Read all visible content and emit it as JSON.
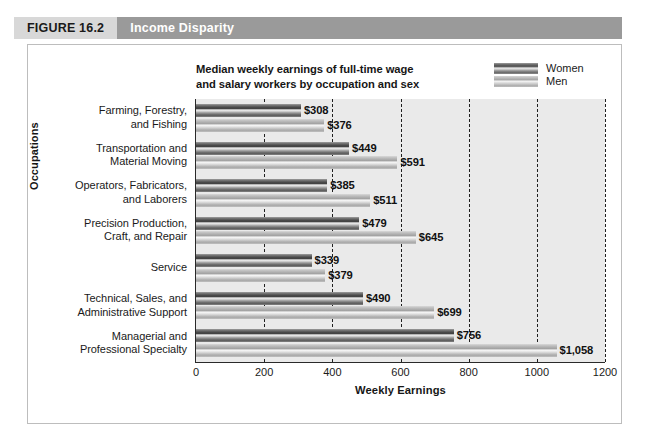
{
  "figure": {
    "number_label": "FIGURE 16.2",
    "title": "Income Disparity",
    "number_bg": "#d8d8d8",
    "title_bg": "#9a9a9a"
  },
  "chart_data": {
    "type": "bar",
    "orientation": "horizontal",
    "title": "Median weekly earnings of full-time wage and salary workers by occupation and sex",
    "title_line1": "Median weekly earnings of full-time wage",
    "title_line2": "and salary workers by occupation and sex",
    "xlabel": "Weekly Earnings",
    "ylabel": "Occupations",
    "xlim": [
      0,
      1200
    ],
    "xticks": [
      0,
      200,
      400,
      600,
      800,
      1000,
      1200
    ],
    "xtick_labels": [
      "0",
      "200",
      "400",
      "600",
      "800",
      "1000",
      "1200"
    ],
    "grid": "vertical-dashed",
    "legend_position": "top-right",
    "categories": [
      "Farming, Forestry, and Fishing",
      "Transportation and Material Moving",
      "Operators, Fabricators, and Laborers",
      "Precision Production, Craft, and Repair",
      "Service",
      "Technical, Sales, and Administrative Support",
      "Managerial and Professional Specialty"
    ],
    "category_lines": [
      [
        "Farming, Forestry,",
        "and Fishing"
      ],
      [
        "Transportation and",
        "Material Moving"
      ],
      [
        "Operators, Fabricators,",
        "and Laborers"
      ],
      [
        "Precision Production,",
        "Craft, and Repair"
      ],
      [
        "Service"
      ],
      [
        "Technical, Sales, and",
        "Administrative Support"
      ],
      [
        "Managerial and",
        "Professional Specialty"
      ]
    ],
    "series": [
      {
        "name": "Women",
        "color": "#4e4e4e",
        "values": [
          308,
          449,
          385,
          479,
          339,
          490,
          756
        ],
        "labels": [
          "$308",
          "$449",
          "$385",
          "$479",
          "$339",
          "$490",
          "$756"
        ]
      },
      {
        "name": "Men",
        "color": "#b4b4b4",
        "values": [
          376,
          591,
          511,
          645,
          379,
          699,
          1058
        ],
        "labels": [
          "$376",
          "$591",
          "$511",
          "$645",
          "$379",
          "$699",
          "$1,058"
        ]
      }
    ]
  }
}
